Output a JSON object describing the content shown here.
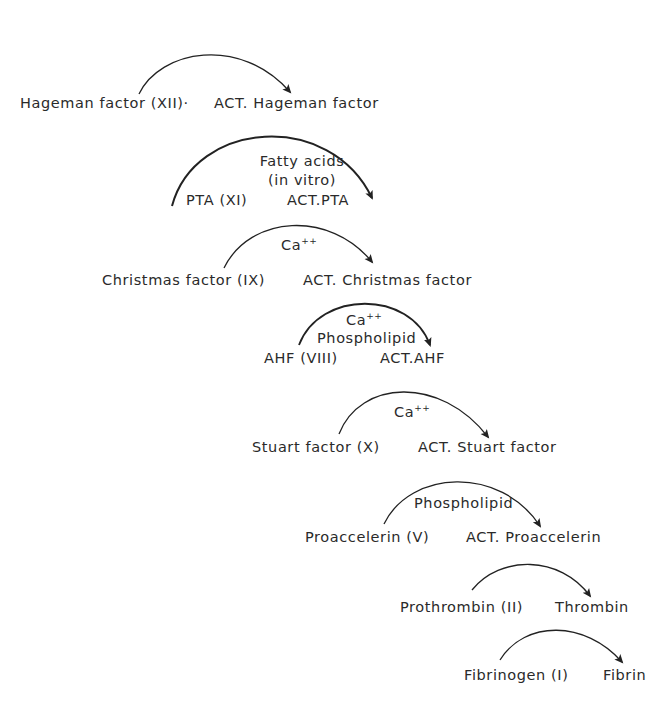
{
  "diagram": {
    "steps": [
      {
        "substrate": "Hageman factor (XII)·",
        "product": "ACT. Hageman factor",
        "cofactor": []
      },
      {
        "substrate": "PTA (XI)",
        "product": "ACT.PTA",
        "cofactor": [
          "Fatty acids",
          "(in vitro)"
        ]
      },
      {
        "substrate": "Christmas factor (IX)",
        "product": "ACT. Christmas factor",
        "cofactor": [
          "Ca++"
        ]
      },
      {
        "substrate": "AHF (VIII)",
        "product": "ACT.AHF",
        "cofactor": [
          "Ca++",
          "Phospholipid"
        ]
      },
      {
        "substrate": "Stuart factor (X)",
        "product": "ACT. Stuart factor",
        "cofactor": [
          "Ca++"
        ]
      },
      {
        "substrate": "Proaccelerin (V)",
        "product": "ACT. Proaccelerin",
        "cofactor": [
          "Phospholipid"
        ]
      },
      {
        "substrate": "Prothrombin (II)",
        "product": "Thrombin",
        "cofactor": []
      },
      {
        "substrate": "Fibrinogen (I)",
        "product": "Fibrin",
        "cofactor": []
      }
    ],
    "ca_base": "Ca",
    "ca_sup": "++",
    "colors": {
      "ink": "#2a2a2a",
      "background": "#ffffff"
    }
  }
}
